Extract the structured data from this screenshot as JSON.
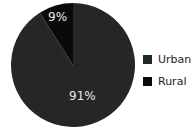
{
  "chart_data": {
    "type": "pie",
    "title": "",
    "categories": [
      "Urban",
      "Rural"
    ],
    "values": [
      91,
      9
    ],
    "labels": [
      "91%",
      "9%"
    ],
    "colors": [
      "#262626",
      "#0a0a0a"
    ],
    "legend_position": "right"
  },
  "legend": {
    "items": [
      {
        "label": "Urban",
        "color": "#262626"
      },
      {
        "label": "Rural",
        "color": "#0a0a0a"
      }
    ]
  },
  "slice_labels": {
    "urban": "91%",
    "rural": "9%"
  }
}
